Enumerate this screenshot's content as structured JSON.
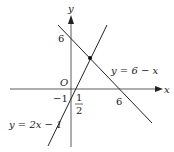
{
  "diagram": {
    "type": "coordinate-graph",
    "axes": {
      "x_label": "x",
      "y_label": "y",
      "origin_label": "O"
    },
    "ticks": {
      "y_six": "6",
      "x_six": "6",
      "y_neg_one": "−1",
      "half_num": "1",
      "half_den": "2"
    },
    "lines": [
      {
        "label": "y = 6 − x",
        "slope": -1,
        "intercept": 6,
        "color": "#222222"
      },
      {
        "label": "y = 2x − 1",
        "slope": 2,
        "intercept": -1,
        "color": "#222222"
      }
    ],
    "intersection": {
      "x": 2.33,
      "y": 3.67
    }
  }
}
